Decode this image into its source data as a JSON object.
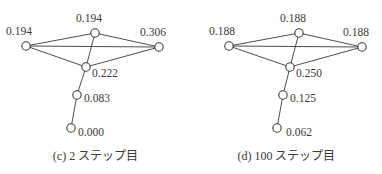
{
  "figure": {
    "background_color": "#ffffff",
    "ink_color": "#3a3a3a",
    "panels": [
      {
        "id": "panel-c",
        "caption_tag": "(c)",
        "caption_number": "2",
        "caption_suffix": "ステップ目",
        "caption_full": "(c) 2 ステップ目",
        "nodes": [
          {
            "id": "left",
            "label": "0.194",
            "cx": 26,
            "cy": 46,
            "lx": 6,
            "ly": 26
          },
          {
            "id": "top",
            "label": "0.194",
            "cx": 95,
            "cy": 33,
            "lx": 76,
            "ly": 13
          },
          {
            "id": "right",
            "label": "0.306",
            "cx": 159,
            "cy": 47,
            "lx": 140,
            "ly": 27
          },
          {
            "id": "center",
            "label": "0.222",
            "cx": 86,
            "cy": 67,
            "lx": 92,
            "ly": 68
          },
          {
            "id": "mid",
            "label": "0.083",
            "cx": 77,
            "cy": 95,
            "lx": 84,
            "ly": 93
          },
          {
            "id": "bottom",
            "label": "0.000",
            "cx": 71,
            "cy": 128,
            "lx": 78,
            "ly": 127
          }
        ],
        "edges": [
          [
            "left",
            "top"
          ],
          [
            "left",
            "right"
          ],
          [
            "left",
            "center"
          ],
          [
            "top",
            "right"
          ],
          [
            "top",
            "center"
          ],
          [
            "center",
            "right"
          ],
          [
            "center",
            "mid"
          ],
          [
            "mid",
            "bottom"
          ]
        ]
      },
      {
        "id": "panel-d",
        "caption_tag": "(d)",
        "caption_number": "100",
        "caption_suffix": "ステップ目",
        "caption_full": "(d) 100 ステップ目",
        "nodes": [
          {
            "id": "left",
            "label": "0.188",
            "cx": 38,
            "cy": 46,
            "lx": 18,
            "ly": 26
          },
          {
            "id": "top",
            "label": "0.188",
            "cx": 108,
            "cy": 33,
            "lx": 89,
            "ly": 13
          },
          {
            "id": "right",
            "label": "0.188",
            "cx": 171,
            "cy": 47,
            "lx": 152,
            "ly": 27
          },
          {
            "id": "center",
            "label": "0.250",
            "cx": 99,
            "cy": 67,
            "lx": 105,
            "ly": 68
          },
          {
            "id": "mid",
            "label": "0.125",
            "cx": 92,
            "cy": 95,
            "lx": 99,
            "ly": 93
          },
          {
            "id": "bottom",
            "label": "0.062",
            "cx": 86,
            "cy": 128,
            "lx": 95,
            "ly": 127
          }
        ],
        "edges": [
          [
            "left",
            "top"
          ],
          [
            "left",
            "right"
          ],
          [
            "left",
            "center"
          ],
          [
            "top",
            "right"
          ],
          [
            "top",
            "center"
          ],
          [
            "center",
            "right"
          ],
          [
            "center",
            "mid"
          ],
          [
            "mid",
            "bottom"
          ]
        ]
      }
    ]
  }
}
